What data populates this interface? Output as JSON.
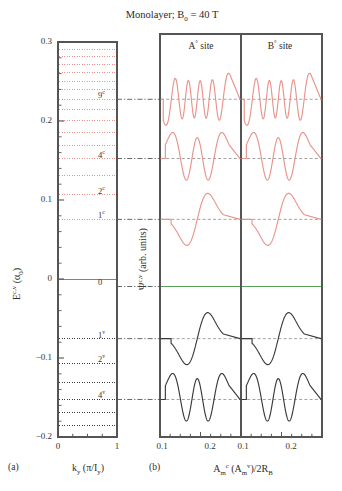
{
  "figure": {
    "title": "Monolayer; B",
    "title_sub": "0",
    "title_rest": " = 40 T",
    "panel_a_tag": "(a)",
    "panel_b_tag": "(b)"
  },
  "left_panel": {
    "ylabel_main": "E",
    "ylabel_sup": "c,v",
    "ylabel_unit": " (α",
    "ylabel_unit_sub": "0",
    "ylabel_unit_end": ")",
    "ytick_labels": [
      "0.3",
      "0.2",
      "0.1",
      "0",
      "−0.1",
      "−0.2"
    ],
    "ytick_values": [
      0.3,
      0.2,
      0.1,
      0.0,
      -0.1,
      -0.2
    ],
    "xtick_labels": [
      "0",
      "1"
    ],
    "xtick_values": [
      0,
      1
    ],
    "xlabel_main": "k",
    "xlabel_sub": "y",
    "xlabel_rest": " (π/I",
    "xlabel_rest_sub": "y",
    "xlabel_end": ")",
    "ylim": [
      -0.2,
      0.3
    ],
    "level_labels": [
      {
        "text": "9",
        "sup": "c",
        "energy": 0.2275
      },
      {
        "text": "4",
        "sup": "c",
        "energy": 0.1525
      },
      {
        "text": "2",
        "sup": "c",
        "energy": 0.1065
      },
      {
        "text": "1",
        "sup": "c",
        "energy": 0.0755
      },
      {
        "text": "0",
        "sup": "",
        "energy": -0.0095
      },
      {
        "text": "1",
        "sup": "v",
        "energy": -0.0755
      },
      {
        "text": "2",
        "sup": "v",
        "energy": -0.1065
      },
      {
        "text": "4",
        "sup": "v",
        "energy": -0.1525
      }
    ],
    "conduction_levels": [
      0.0755,
      0.1065,
      0.1305,
      0.1525,
      0.1695,
      0.186,
      0.201,
      0.2145,
      0.2275,
      0.2395,
      0.2505,
      0.2615,
      0.2715,
      0.2815,
      0.291
    ],
    "valence_levels": [
      -0.0755,
      -0.1065,
      -0.1305,
      -0.1525,
      -0.1695,
      -0.186,
      -0.2
    ],
    "zero_level": 0.0,
    "conduction_color": "#e8938b",
    "valence_color": "#3a3a3a",
    "zero_color": "#5aa05a"
  },
  "right_panel": {
    "ylabel_main": "Ψ",
    "ylabel_sup": "c,v",
    "ylabel_rest": " (arb. units)",
    "site_a_label": "A",
    "site_a_sup": "°",
    "site_a_rest": " site",
    "site_b_label": "B",
    "site_b_sup": "°",
    "site_b_rest": " site",
    "xlabel_main": "A",
    "xlabel_sub": "m",
    "xlabel_sup": "c",
    "xlabel_mid": " (A",
    "xlabel_mid_sub": "m",
    "xlabel_mid_sup": "v",
    "xlabel_end": ")/2R",
    "xlabel_end_sub": "B",
    "xtick_labels": [
      "0.1",
      "0.2",
      "0.1",
      "0.2"
    ],
    "curves": [
      {
        "name": "9c",
        "energy": 0.2275,
        "n": 9,
        "color": "#e8938b",
        "site_a_shift": 0,
        "site_b_shift": 1
      },
      {
        "name": "4c",
        "energy": 0.1525,
        "n": 4,
        "color": "#e8938b",
        "site_a_shift": 0,
        "site_b_shift": 1
      },
      {
        "name": "1c",
        "energy": 0.0755,
        "n": 1,
        "color": "#e8938b",
        "site_a_shift": 0,
        "site_b_shift": 1
      },
      {
        "name": "0",
        "energy": -0.0095,
        "n": 0,
        "color": "#5aa05a",
        "site_a_shift": -1,
        "site_b_shift": 0
      },
      {
        "name": "1v",
        "energy": -0.0755,
        "n": 1,
        "color": "#3a3a3a",
        "site_a_shift": 0,
        "site_b_shift": 1
      },
      {
        "name": "4v",
        "energy": -0.1525,
        "n": 4,
        "color": "#3a3a3a",
        "site_a_shift": 0,
        "site_b_shift": 1
      }
    ]
  }
}
